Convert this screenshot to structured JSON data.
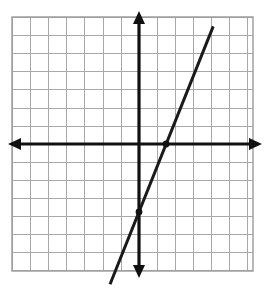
{
  "figure": {
    "name": "coordinate-plane-linear-graph",
    "width": 270,
    "height": 297,
    "background_color": "#ffffff"
  },
  "chart_data": {
    "type": "line",
    "title": "",
    "subtitle": "",
    "xlabel": "",
    "ylabel": "",
    "grid": true,
    "legend": false,
    "legend_position": "none",
    "xlim": [
      -7,
      6.2
    ],
    "ylim": [
      -7,
      7
    ],
    "x_ticks": [
      -7,
      -6,
      -5,
      -4,
      -3,
      -2,
      -1,
      0,
      1,
      2,
      3,
      4,
      5,
      6
    ],
    "y_ticks": [
      -7,
      -6,
      -5,
      -4,
      -3,
      -2,
      -1,
      0,
      1,
      2,
      3,
      4,
      5,
      6,
      7
    ],
    "x_tick_labels": [],
    "y_tick_labels": [],
    "series": [
      {
        "name": "line",
        "equation": "y = 2.5x - 3.75",
        "slope": 2.5,
        "y_intercept": -3.75,
        "x_intercept": 1.5,
        "x": [
          -1.6,
          4.1
        ],
        "y": [
          -7.75,
          6.5
        ],
        "color": "#1a1a1a"
      }
    ],
    "points": [
      {
        "label": "y-intercept",
        "x": 0,
        "y": -3.75,
        "marked": true
      },
      {
        "label": "x-intercept",
        "x": 1.5,
        "y": 0,
        "marked": true
      }
    ],
    "annotations": []
  },
  "axes": {
    "x_axis": {
      "label": "x-axis",
      "color": "#111111",
      "arrow_left": true,
      "arrow_right": true
    },
    "y_axis": {
      "label": "y-axis",
      "color": "#111111",
      "arrow_up": true,
      "arrow_down": true
    },
    "origin": {
      "x": 0,
      "y": 0
    }
  },
  "style": {
    "grid_line_color": "#a8a8a8",
    "grid_border_color": "#9a9a9a",
    "axis_color": "#111111",
    "line_color": "#1a1a1a",
    "point_color": "#111111"
  }
}
